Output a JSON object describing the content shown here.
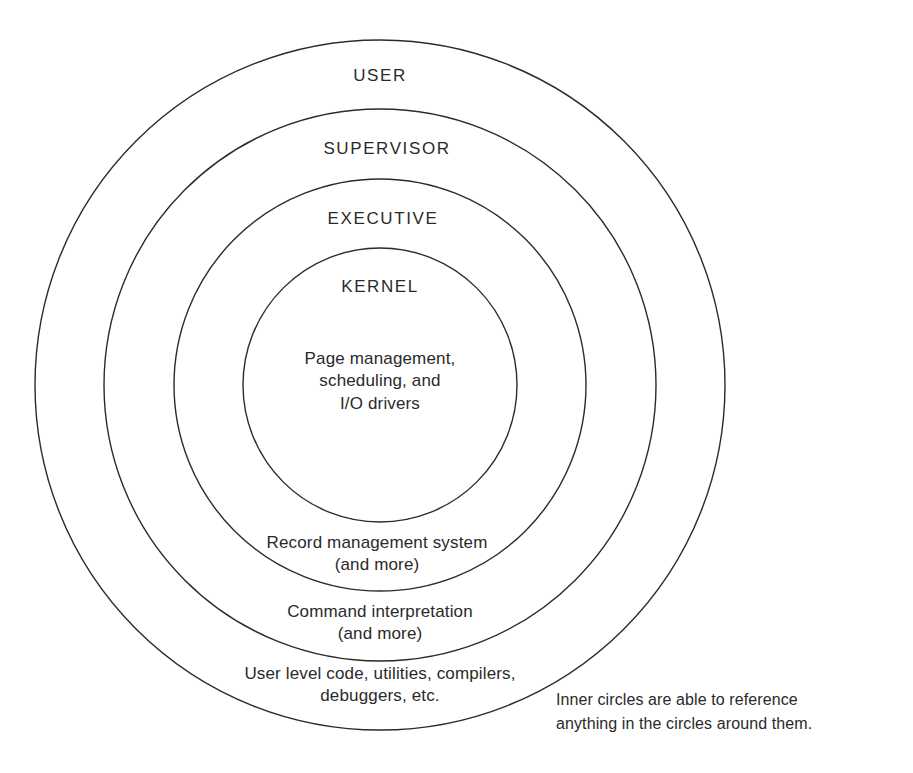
{
  "diagram": {
    "background_color": "#ffffff",
    "stroke_color": "#2b2b2b",
    "text_color": "#2a2a2a",
    "center": {
      "x": 380,
      "y": 385
    },
    "rings": [
      {
        "id": "user",
        "name": "USER",
        "radius": 345,
        "name_y": 65,
        "description_lines": [
          "User level code, utilities, compilers,",
          "debuggers, etc."
        ],
        "description_y": 663
      },
      {
        "id": "supervisor",
        "name": "SUPERVISOR",
        "radius": 276,
        "name_y": 138,
        "description_lines": [
          "Command interpretation",
          "(and more)"
        ],
        "description_y": 601
      },
      {
        "id": "executive",
        "name": "EXECUTIVE",
        "radius": 206,
        "name_y": 208,
        "description_lines": [
          "Record management system",
          "(and more)"
        ],
        "description_y": 532
      },
      {
        "id": "kernel",
        "name": "KERNEL",
        "radius": 137,
        "name_y": 276,
        "description_lines": [
          "Page management,",
          "scheduling, and",
          "I/O drivers"
        ],
        "description_y": 348
      }
    ],
    "caption": {
      "lines": [
        "Inner circles are able to reference",
        "anything in the circles around them."
      ],
      "x": 556,
      "y": 688
    }
  }
}
